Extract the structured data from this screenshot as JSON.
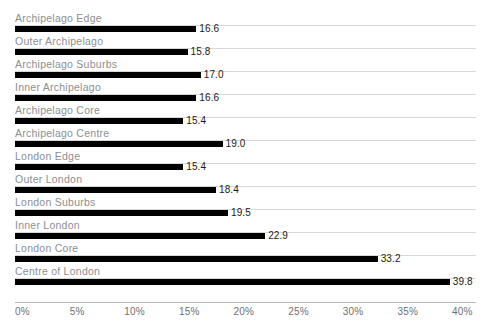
{
  "chart_data": {
    "type": "bar",
    "orientation": "horizontal",
    "title": "",
    "xlabel": "",
    "ylabel": "",
    "xlim": [
      0,
      40
    ],
    "grid": true,
    "legend": false,
    "xtick_labels": [
      "0%",
      "5%",
      "10%",
      "15%",
      "20%",
      "25%",
      "30%",
      "35%",
      "40%"
    ],
    "xtick_values": [
      0,
      5,
      10,
      15,
      20,
      25,
      30,
      35,
      40
    ],
    "categories": [
      "Archipelago Edge",
      "Outer Archipelago",
      "Archipelago Suburbs",
      "Inner Archipelago",
      "Archipelago Core",
      "Archipelago Centre",
      "London Edge",
      "Outer London",
      "London Suburbs",
      "Inner London",
      "London Core",
      "Centre of London"
    ],
    "values": [
      16.6,
      15.8,
      17.0,
      16.6,
      15.4,
      19.0,
      15.4,
      18.4,
      19.5,
      22.9,
      33.2,
      39.8
    ],
    "value_labels": [
      "16.6",
      "15.8",
      "17.0",
      "16.6",
      "15.4",
      "19.0",
      "15.4",
      "18.4",
      "19.5",
      "22.9",
      "33.2",
      "39.8"
    ],
    "colors": {
      "bar": "#000000",
      "gridline": "#d8d8da",
      "axis": "#b9b9bc",
      "category_label": "#8e8e92",
      "value_label": "#1a1a1a",
      "background": "#ffffff"
    }
  }
}
